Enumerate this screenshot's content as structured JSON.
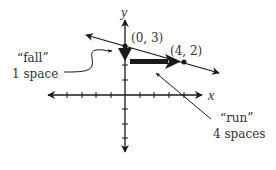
{
  "diagram": {
    "type": "coordinate-plane-slope",
    "axes": {
      "x_label": "x",
      "y_label": "y",
      "x_ticks": [
        -5,
        -4,
        -3,
        -2,
        -1,
        1,
        2,
        3,
        4,
        5
      ],
      "y_ticks": [
        -4,
        -3,
        -2,
        -1,
        1,
        2,
        3
      ]
    },
    "points": [
      {
        "label": "(0, 3)",
        "x": 0,
        "y": 3
      },
      {
        "label": "(4, 2)",
        "x": 4,
        "y": 2
      }
    ],
    "line": {
      "slope": "-1/4",
      "y_intercept": 3
    },
    "annotations": {
      "fall": {
        "line1": "“fall”",
        "line2": "1 space"
      },
      "run": {
        "line1": "“run”",
        "line2": "4 spaces"
      }
    },
    "colors": {
      "ink": "#1a1a1a",
      "text": "#333333"
    }
  }
}
